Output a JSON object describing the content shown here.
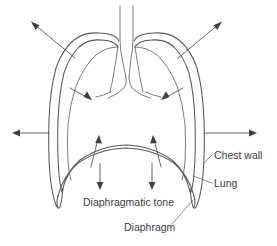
{
  "figure": {
    "background_color": "#ffffff",
    "stroke_color": "#55585c",
    "text_color": "#3a3d41"
  },
  "labels": {
    "chest_wall": "Chest wall",
    "lung": "Lung",
    "diaphragmatic_tone": "Diaphragmatic tone",
    "diaphragm": "Diaphragm"
  },
  "structures": [
    {
      "name": "trachea",
      "label": "trachea"
    },
    {
      "name": "bronchi",
      "label": "bronchi"
    },
    {
      "name": "chest-wall-outline",
      "label": "chest wall"
    },
    {
      "name": "lung-outline",
      "label": "lung"
    },
    {
      "name": "diaphragm-dome",
      "label": "diaphragm"
    }
  ],
  "force_arrows": [
    {
      "name": "chest-wall-recoil-upper-left",
      "direction": "outward-up-left",
      "meaning": "chest wall outward recoil"
    },
    {
      "name": "chest-wall-recoil-upper-right",
      "direction": "outward-up-right",
      "meaning": "chest wall outward recoil"
    },
    {
      "name": "chest-wall-recoil-left",
      "direction": "outward-left",
      "meaning": "chest wall outward recoil"
    },
    {
      "name": "chest-wall-recoil-right",
      "direction": "outward-right",
      "meaning": "chest wall outward recoil"
    },
    {
      "name": "lung-recoil-left",
      "direction": "inward-right",
      "meaning": "lung inward elastic recoil"
    },
    {
      "name": "lung-recoil-right",
      "direction": "inward-left",
      "meaning": "lung inward elastic recoil"
    },
    {
      "name": "diaphragm-tone-up-left",
      "direction": "upward",
      "meaning": "diaphragmatic tone"
    },
    {
      "name": "diaphragm-tone-up-right",
      "direction": "upward",
      "meaning": "diaphragmatic tone"
    },
    {
      "name": "diaphragm-tone-down-left",
      "direction": "downward",
      "meaning": "diaphragmatic tone"
    },
    {
      "name": "diaphragm-tone-down-right",
      "direction": "downward",
      "meaning": "diaphragmatic tone"
    }
  ]
}
